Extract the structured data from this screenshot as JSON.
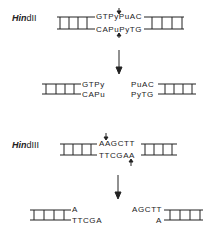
{
  "diagram": {
    "enzymes": [
      {
        "name_italic": "Hin",
        "name_rest": "dII",
        "site_top": "GTPyPuAC",
        "site_bottom": "CAPuPyTG",
        "cut": "blunt",
        "fragment_left_top": "GTPy",
        "fragment_left_bottom": "CAPu",
        "fragment_right_top": "PuAC",
        "fragment_right_bottom": "PyTG"
      },
      {
        "name_italic": "Hin",
        "name_rest": "dIII",
        "site_top": "AAGCTT",
        "site_bottom": "TTCGAA",
        "cut": "staggered",
        "fragment_left_top": "A",
        "fragment_left_bottom": "TTCGA",
        "fragment_right_top": "AGCTT",
        "fragment_right_bottom": "A"
      }
    ],
    "colors": {
      "ink": "#222222",
      "background": "#ffffff"
    }
  }
}
